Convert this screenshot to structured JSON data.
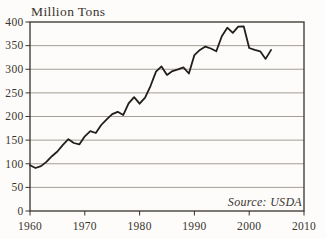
{
  "chart_data": {
    "type": "line",
    "title": "Million Tons",
    "source": "Source: USDA",
    "xlim": [
      1960,
      2010
    ],
    "ylim": [
      0,
      400
    ],
    "x_ticks": [
      1960,
      1970,
      1980,
      1990,
      2000,
      2010
    ],
    "y_ticks": [
      400,
      350,
      300,
      250,
      200,
      150,
      100,
      50,
      0
    ],
    "grid": "horizontal",
    "legend": "none",
    "line_color": "#211e1b",
    "grid_color": "#9a948c",
    "frame_color": "#38322c",
    "series": [
      {
        "name": "production-million-tons",
        "x": [
          1960,
          1961,
          1962,
          1963,
          1964,
          1965,
          1966,
          1967,
          1968,
          1969,
          1970,
          1971,
          1972,
          1973,
          1974,
          1975,
          1976,
          1977,
          1978,
          1979,
          1980,
          1981,
          1982,
          1983,
          1984,
          1985,
          1986,
          1987,
          1988,
          1989,
          1990,
          1991,
          1992,
          1993,
          1994,
          1995,
          1996,
          1997,
          1998,
          1999,
          2000,
          2001,
          2002,
          2003,
          2004
        ],
        "values": [
          97,
          91,
          95,
          104,
          116,
          126,
          140,
          152,
          144,
          141,
          158,
          169,
          165,
          182,
          194,
          205,
          210,
          203,
          228,
          241,
          227,
          240,
          265,
          295,
          306,
          288,
          296,
          300,
          304,
          291,
          330,
          341,
          348,
          344,
          338,
          370,
          388,
          377,
          390,
          391,
          345,
          341,
          338,
          322,
          341
        ]
      }
    ]
  }
}
